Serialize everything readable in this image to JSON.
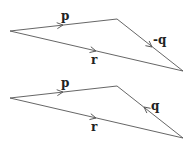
{
  "diagrams": [
    {
      "name": "top-triangle",
      "vertices": {
        "left": [
          10,
          31
        ],
        "top_right": [
          117,
          19
        ],
        "bottom_right": [
          183,
          71
        ]
      },
      "vectors": [
        {
          "label": "p",
          "from": "left",
          "to": "top_right"
        },
        {
          "label": "-q",
          "from": "top_right",
          "to": "bottom_right"
        },
        {
          "label": "r",
          "from": "left",
          "to": "bottom_right"
        }
      ]
    },
    {
      "name": "bottom-triangle",
      "vertices": {
        "left": [
          10,
          98
        ],
        "top_right": [
          117,
          86
        ],
        "bottom_right": [
          183,
          138
        ]
      },
      "vectors": [
        {
          "label": "p",
          "from": "left",
          "to": "top_right"
        },
        {
          "label": "q",
          "from": "bottom_right",
          "to": "top_right"
        },
        {
          "label": "r",
          "from": "left",
          "to": "bottom_right"
        }
      ]
    }
  ],
  "labels": {
    "top_p": "p",
    "top_minus_q": "-q",
    "top_r": "r",
    "bottom_p": "p",
    "bottom_q": "q",
    "bottom_r": "r"
  }
}
